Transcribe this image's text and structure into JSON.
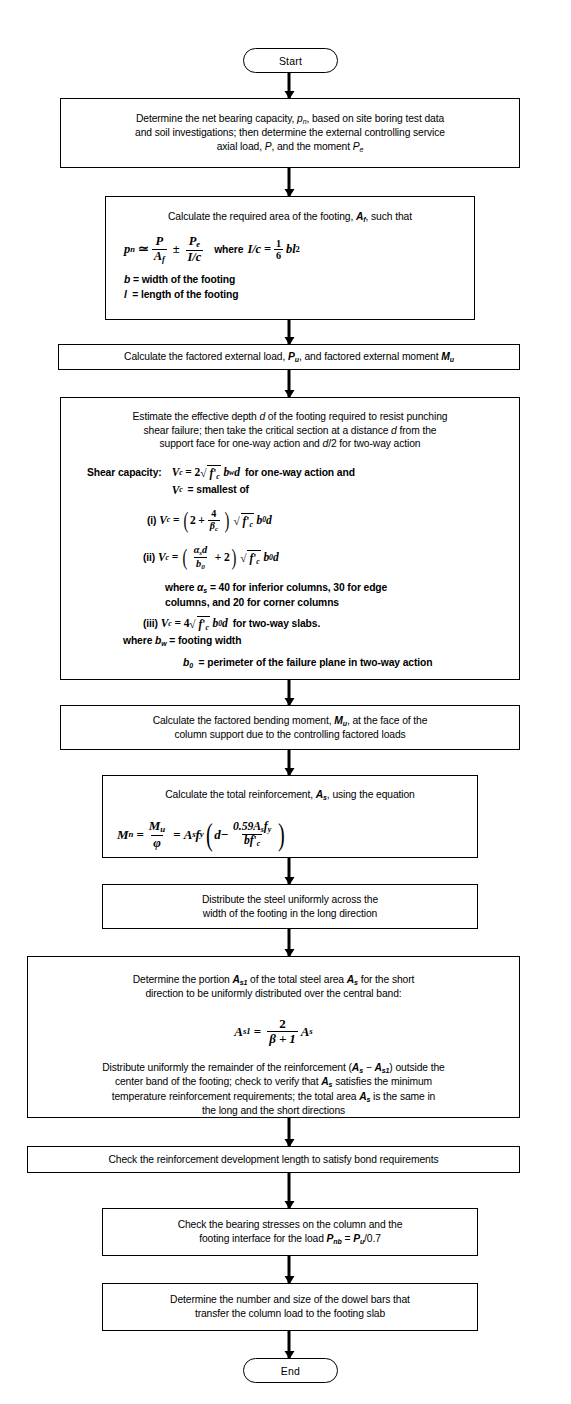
{
  "start": {
    "label": "Start"
  },
  "end": {
    "label": "End"
  },
  "nodes": [
    {
      "id": "determine-net-bearing-capacity",
      "lines": [
        "Determine the net bearing capacity, pₙ, based on site boring test data",
        "and soil investigations; then determine the external controlling service",
        "axial load, P, and the moment Pₑ"
      ]
    },
    {
      "id": "calculate-required-area",
      "lead": "Calculate the required area of the footing, Aƒ, such that",
      "equation": "pₙ ≃ P/Aƒ ± Pₑ/(I/c)   where I/c = (1/6) bl²",
      "definitions": [
        "b = width of the footing",
        "l = length of the footing"
      ]
    },
    {
      "id": "calculate-factored-load",
      "lines": [
        "Calculate the factored external load, Pᵤ, and factored external moment Mᵤ"
      ]
    },
    {
      "id": "estimate-effective-depth",
      "lines": [
        "Estimate the effective depth d of the footing required to resist punching",
        "shear failure; then take the critical section at a distance d from the",
        "support face for one-way action and d/2 for two-way action"
      ],
      "shear_label": "Shear capacity:",
      "shear_lines": [
        "Vᶜ = 2 √(f'ᶜ) bᵡd for one-way action and",
        "Vᶜ = smallest of",
        "(i)  Vᶜ = (2 + 4/βᶜ) √(f'ᶜ) b₀d",
        "(ii)  Vᶜ = (αₛd/b₀ + 2) √(f'ᶜ) b₀d"
      ],
      "alpha_note": [
        "where αₛ = 40 for inferior columns, 30 for edge",
        "columns, and 20 for corner columns"
      ],
      "third_line": "(iii)  Vᶜ = 4 √(f'ᶜ) b₀d for two-way slabs.",
      "where_bw": "where bᵡ = footing width",
      "where_b0": "b₀ = perimeter of the failure plane in two-way action"
    },
    {
      "id": "calculate-bending-moment",
      "lines": [
        "Calculate the factored bending moment, Mᵤ, at the face of the",
        "column support due to the controlling factored loads"
      ]
    },
    {
      "id": "calculate-total-reinforcement",
      "lead": "Calculate the total reinforcement, Aₛ, using the equation",
      "equation": "Mₙ = Mᵤ/φ = Aₛfᵧ (d − 0.59Aₛfᵧ/bf'ᶜ)"
    },
    {
      "id": "distribute-steel-uniformly",
      "lines": [
        "Distribute the steel uniformly across the",
        "width of the footing in the long direction"
      ]
    },
    {
      "id": "determine-portion-as1",
      "lines": [
        "Determine the portion Aₛ₁ of the total steel area Aₛ for the short",
        "direction to be uniformly distributed over the central band:"
      ],
      "equation": "Aₛ₁ = 2/(β + 1) Aₛ",
      "tail_lines": [
        "Distribute uniformly the remainder of the reinforcement (Aₛ − Aₛ₁) outside the",
        "center band of the footing; check to verify that Aₛ satisfies the minimum",
        "temperature reinforcement requirements; the total area Aₛ is the same in",
        "the long and the short directions"
      ]
    },
    {
      "id": "check-development-length",
      "lines": [
        "Check the reinforcement development length to satisfy bond requirements"
      ]
    },
    {
      "id": "check-bearing-stresses",
      "lines": [
        "Check the bearing stresses on the column and the",
        "footing interface for the load Pₙₕ = Pᵤ/0.7"
      ]
    },
    {
      "id": "determine-dowel-bars",
      "lines": [
        "Determine the number and size of the dowel bars that",
        "transfer the column load to the footing slab"
      ]
    }
  ],
  "colors": {
    "ink": "#000000",
    "paper": "#ffffff"
  }
}
